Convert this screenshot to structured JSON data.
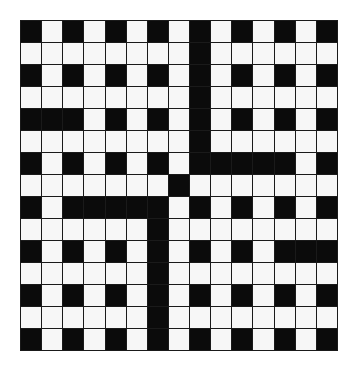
{
  "puzzle": {
    "type": "crossword-grid",
    "rows": 15,
    "cols": 15,
    "colors": {
      "block": "#0b0b0b",
      "open": "#f7f7f7",
      "line": "#1a1a1a",
      "background": "#ffffff"
    },
    "grid": [
      "#.#.#.#.#.#.#.#",
      "........#......",
      "#.#.#.#.#.#.#.#",
      "........#......",
      "###.#.#.#.#.#.#",
      "........#......",
      "#.#.#.#.#####.#",
      ".......#.......",
      "#.#####.#.#.#.#",
      "......#........",
      "#.#.#.#.#.#.###",
      "......#........",
      "#.#.#.#.#.#.#.#",
      "......#........",
      "#.#.#.#.#.#.#.#"
    ]
  }
}
